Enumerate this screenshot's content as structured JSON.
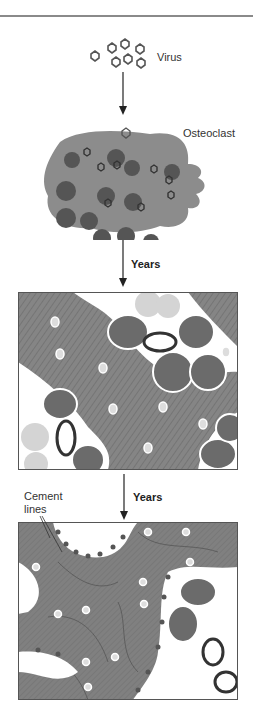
{
  "figure": {
    "labels": {
      "virus": "Virus",
      "osteoclast": "Osteoclast",
      "years_1": "Years",
      "years_2": "Years",
      "cement_lines": "Cement\nlines"
    },
    "stages": [
      {
        "name": "virus-infection",
        "description": "Virus particles approaching"
      },
      {
        "name": "infected-osteoclast",
        "description": "Multinucleated osteoclast containing viral particles"
      },
      {
        "name": "early-bone-remodeling",
        "description": "Lamellar bone with giant osteoclasts"
      },
      {
        "name": "late-mosaic-bone",
        "description": "Mosaic bone with cement lines and fibrous marrow"
      }
    ],
    "colors": {
      "bone": "#7f7f7f",
      "cell": "#8c8c8c",
      "nucleus": "#5a5a5a",
      "marrow": "#ffffff",
      "fat": "#d4d4d4",
      "line": "#222222"
    }
  }
}
